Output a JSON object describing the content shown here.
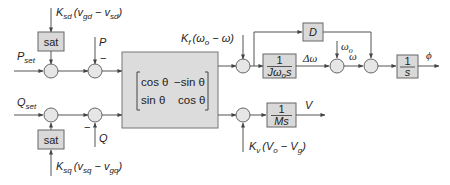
{
  "diagram": {
    "type": "control-block-diagram",
    "inputs": {
      "p_set": {
        "main": "P",
        "sub": "set"
      },
      "q_set": {
        "main": "Q",
        "sub": "set"
      },
      "p_feedback": "P",
      "q_feedback": "Q",
      "minus_sign": "−"
    },
    "sat_blocks": [
      {
        "label": "sat",
        "input": {
          "k": "K",
          "k_sub": "sd",
          "open": "(v",
          "a_sub": "gd",
          "dash": " − v",
          "b_sub": "sd",
          "close": ")"
        }
      },
      {
        "label": "sat",
        "input": {
          "k": "K",
          "k_sub": "sq",
          "open": "(v",
          "a_sub": "sq",
          "dash": " − v",
          "b_sub": "gq",
          "close": ")"
        }
      }
    ],
    "rotation_matrix": {
      "r1c1": "cos θ",
      "r1c2": "−sin θ",
      "r2c1": "sin θ",
      "r2c2": "cos θ"
    },
    "frequency_droop": {
      "k": "K",
      "k_sub": "f",
      "open": "(ω",
      "a_sub": "o",
      "rest": " − ω)"
    },
    "voltage_droop": {
      "k": "K",
      "k_sub": "v",
      "open": "(V",
      "a_sub": "o",
      "dash": " − V",
      "b_sub": "g",
      "close": ")"
    },
    "blocks": {
      "damping": "D",
      "inertia": {
        "num": "1",
        "den": "Jω",
        "den_sub": "o",
        "den_tail": "s"
      },
      "integrator": {
        "num": "1",
        "den": "s"
      },
      "voltage": {
        "num": "1",
        "den": "Ms"
      }
    },
    "signals": {
      "delta_omega": "Δω",
      "omega_o": {
        "main": "ω",
        "sub": "o"
      },
      "omega": "ω",
      "phi": "ϕ",
      "voltage": "V"
    }
  }
}
